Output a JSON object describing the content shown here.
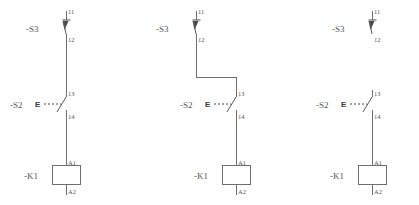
{
  "document": {
    "title": "Relay Control Circuit Schematic",
    "background_color": "#ffffff",
    "line_color": "#6e6e6e",
    "text_color": "#555555"
  },
  "circuits": [
    {
      "id": "circuit-1",
      "name": "straight-wired-circuit",
      "switch_top": {
        "designation": "-S3",
        "type": "pushbutton-nc",
        "terminal_in": "11",
        "terminal_out": "12",
        "connected_downstream": true
      },
      "switch_mid": {
        "designation": "-S2",
        "type": "contact-nc-actuated",
        "actuator_symbol": "E",
        "terminal_in": "13",
        "terminal_out": "14"
      },
      "coil": {
        "designation": "-K1",
        "type": "relay-coil",
        "terminal_top": "A1",
        "terminal_bottom": "A2"
      },
      "routing": "straight"
    },
    {
      "id": "circuit-2",
      "name": "offset-wired-circuit",
      "switch_top": {
        "designation": "-S3",
        "type": "pushbutton-nc",
        "terminal_in": "11",
        "terminal_out": "12",
        "connected_downstream": true
      },
      "switch_mid": {
        "designation": "-S2",
        "type": "contact-nc-actuated",
        "actuator_symbol": "E",
        "terminal_in": "13",
        "terminal_out": "14"
      },
      "coil": {
        "designation": "-K1",
        "type": "relay-coil",
        "terminal_top": "A1",
        "terminal_bottom": "A2"
      },
      "routing": "offset-jog"
    },
    {
      "id": "circuit-3",
      "name": "isolated-switch-circuit",
      "switch_top": {
        "designation": "-S3",
        "type": "pushbutton-nc",
        "terminal_in": "11",
        "terminal_out": "12",
        "connected_downstream": false
      },
      "switch_mid": {
        "designation": "-S2",
        "type": "contact-nc-actuated",
        "actuator_symbol": "E",
        "terminal_in": "13",
        "terminal_out": "14"
      },
      "coil": {
        "designation": "-K1",
        "type": "relay-coil",
        "terminal_top": "A1",
        "terminal_bottom": "A2"
      },
      "routing": "disconnected"
    }
  ]
}
